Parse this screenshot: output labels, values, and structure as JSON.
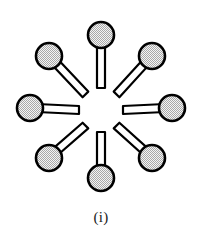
{
  "figure": {
    "caption": "(i)",
    "title": "",
    "node_count": 8,
    "center": {
      "x": 101,
      "y": 110
    },
    "hub_gap_radius": 22,
    "node_radius": 13,
    "stem_half_width": 4,
    "outline_color": "#000000",
    "outline_width": 2.2,
    "node_fill_color": "#d2d2d2",
    "stem_fill_color": "#ffffff",
    "background_color": "#ffffff",
    "nodes": [
      {
        "id": "node-n",
        "label": "",
        "angle_deg": 270,
        "cx": 101,
        "cy": 35,
        "r": 13
      },
      {
        "id": "node-ne",
        "label": "",
        "angle_deg": 315,
        "cx": 152,
        "cy": 56,
        "r": 13
      },
      {
        "id": "node-e",
        "label": "",
        "angle_deg": 0,
        "cx": 172,
        "cy": 108,
        "r": 13
      },
      {
        "id": "node-se",
        "label": "",
        "angle_deg": 45,
        "cx": 152,
        "cy": 158,
        "r": 13
      },
      {
        "id": "node-s",
        "label": "",
        "angle_deg": 90,
        "cx": 101,
        "cy": 178,
        "r": 13
      },
      {
        "id": "node-sw",
        "label": "",
        "angle_deg": 135,
        "cx": 49,
        "cy": 158,
        "r": 13
      },
      {
        "id": "node-w",
        "label": "",
        "angle_deg": 180,
        "cx": 30,
        "cy": 108,
        "r": 13
      },
      {
        "id": "node-nw",
        "label": "",
        "angle_deg": 225,
        "cx": 49,
        "cy": 56,
        "r": 13
      }
    ]
  }
}
